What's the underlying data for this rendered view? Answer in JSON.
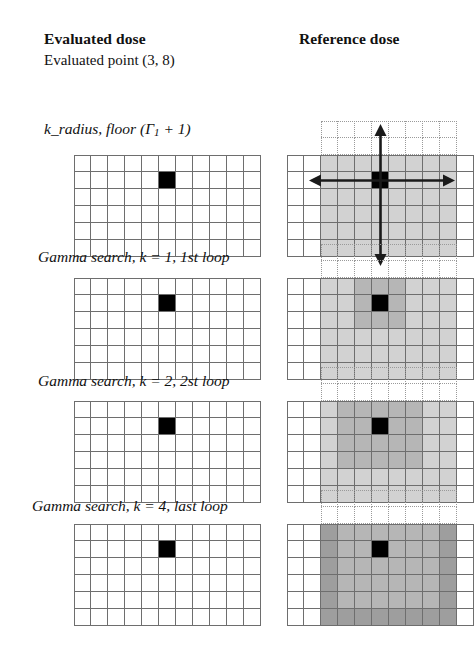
{
  "headers": {
    "evaluated_dose": "Evaluated dose",
    "evaluated_point": "Evaluated point (3, 8)",
    "reference_dose": "Reference dose"
  },
  "rows": [
    {
      "label_prefix": "k_radius, floor (Γ",
      "label_sub": "1",
      "label_suffix": " + 1)",
      "label_full": "k_radius, floor (Γ1 + 1)"
    },
    {
      "label_prefix": "Gamma search, k = 1, 1st loop",
      "label_sub": "",
      "label_suffix": "",
      "label_full": "Gamma search, k = 1, 1st loop"
    },
    {
      "label_prefix": "Gamma search, k = 2, 2st loop",
      "label_sub": "",
      "label_suffix": "",
      "label_full": "Gamma search, k = 2, 2st loop"
    },
    {
      "label_prefix": "Gamma search, k = 4, last loop",
      "label_sub": "",
      "label_suffix": "",
      "label_full": "Gamma search, k = 4, last loop"
    }
  ],
  "grid": {
    "columns": 11,
    "rows": 6,
    "cell_size": 17,
    "marked_cell_column": 5,
    "marked_cell_row": 1,
    "dotted_rows_above": 2,
    "dotted_column_start": 2,
    "dotted_column_end": 9
  },
  "colors": {
    "grid_line": "#6e6e6e",
    "dotted_line": "#9a9a9a",
    "marked_cell": "#000000",
    "shade_light": "#d2d2d2",
    "shade_medium": "#b6b6b6",
    "shade_dark": "#9e9e9e",
    "arrow": "#1a1a1a",
    "background": "#ffffff"
  },
  "shading": {
    "row1": {
      "light_columns": [
        2,
        9
      ],
      "description": "uniform light shading columns 3-10"
    },
    "row2": {
      "light_columns": [
        2,
        9
      ],
      "dark_block": [
        4,
        6,
        0,
        2
      ],
      "description": "light field with dark 3x3 around point"
    },
    "row3": {
      "light_columns": [
        2,
        9
      ],
      "mid_block": [
        3,
        7,
        0,
        3
      ],
      "description": "light field with medium 5x4 ring"
    },
    "row4": {
      "light_columns": [
        2,
        9
      ],
      "edge_columns": [
        2,
        9
      ],
      "description": "uniform medium field with darker border columns"
    }
  },
  "arrows": {
    "up": "arrow-up",
    "down": "arrow-down",
    "left": "arrow-left",
    "right": "arrow-right"
  }
}
